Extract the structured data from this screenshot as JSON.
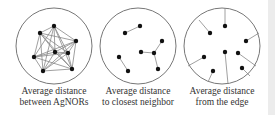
{
  "panels": [
    {
      "id": "between",
      "caption": [
        "Average distance",
        "between AgNORs"
      ],
      "circle": {
        "cx": 54,
        "cy": 46,
        "r": 38
      },
      "points": [
        [
          54,
          26
        ],
        [
          40,
          33
        ],
        [
          76,
          41
        ],
        [
          55,
          52
        ],
        [
          68,
          53
        ],
        [
          34,
          57
        ],
        [
          43,
          71
        ],
        [
          72,
          69
        ]
      ],
      "mode": "complete"
    },
    {
      "id": "closest",
      "caption": [
        "Average distance",
        "to closest neighbor"
      ],
      "circle": {
        "cx": 138,
        "cy": 46,
        "r": 38
      },
      "points": [
        [
          125,
          33
        ],
        [
          140,
          26
        ],
        [
          141,
          52
        ],
        [
          154,
          53
        ],
        [
          162,
          41
        ],
        [
          158,
          69
        ],
        [
          119,
          57
        ],
        [
          128,
          71
        ]
      ],
      "edges": [
        [
          0,
          1
        ],
        [
          2,
          3
        ],
        [
          3,
          4
        ],
        [
          3,
          5
        ],
        [
          6,
          7
        ]
      ],
      "mode": "edges"
    },
    {
      "id": "edge",
      "caption": [
        "Average distance",
        "from the edge"
      ],
      "circle": {
        "cx": 222,
        "cy": 46,
        "r": 38
      },
      "points": [
        [
          225,
          26
        ],
        [
          210,
          33
        ],
        [
          246,
          41
        ],
        [
          225,
          52
        ],
        [
          238,
          53
        ],
        [
          204,
          57
        ],
        [
          213,
          71
        ],
        [
          242,
          68
        ]
      ],
      "edge_targets": [
        [
          225,
          8
        ],
        [
          199,
          20
        ],
        [
          259,
          33
        ],
        [
          228,
          84
        ],
        [
          256,
          66
        ],
        [
          188,
          66
        ],
        [
          208,
          82
        ],
        [
          250,
          76
        ]
      ],
      "mode": "to-edge"
    }
  ],
  "colors": {
    "circle": "#777777",
    "line": "#888888",
    "point": "#111111",
    "text": "#333333"
  }
}
